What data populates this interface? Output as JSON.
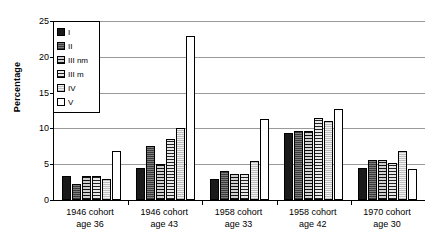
{
  "chart_data": {
    "type": "bar",
    "title": "",
    "xlabel": "",
    "ylabel": "Percentage",
    "ylim": [
      0,
      25
    ],
    "yticks": [
      0,
      5,
      10,
      15,
      20,
      25
    ],
    "grid": true,
    "legend_position": "top-left-inside",
    "categories": [
      "1946 cohort age 36",
      "1946 cohort age 43",
      "1958 cohort age 33",
      "1958 cohort age 42",
      "1970 cohort age 30"
    ],
    "category_lines": [
      [
        "1946 cohort",
        "age 36"
      ],
      [
        "1946 cohort",
        "age 43"
      ],
      [
        "1958 cohort",
        "age 33"
      ],
      [
        "1958 cohort",
        "age 42"
      ],
      [
        "1970 cohort",
        "age 30"
      ]
    ],
    "series": [
      {
        "name": "I",
        "fill": "solid-black",
        "values": [
          3.3,
          4.5,
          3.0,
          9.3,
          4.5
        ]
      },
      {
        "name": "II",
        "fill": "dark-dotted",
        "values": [
          2.2,
          7.6,
          4.0,
          9.6,
          5.6
        ]
      },
      {
        "name": "III nm",
        "fill": "h-lines",
        "values": [
          3.3,
          5.0,
          3.7,
          9.6,
          5.6
        ]
      },
      {
        "name": "III m",
        "fill": "crosshatch",
        "values": [
          3.3,
          8.5,
          3.7,
          11.4,
          5.2
        ]
      },
      {
        "name": "IV",
        "fill": "light-dotted",
        "values": [
          3.0,
          10.0,
          5.5,
          11.0,
          6.8
        ]
      },
      {
        "name": "V",
        "fill": "white",
        "values": [
          6.8,
          22.9,
          11.3,
          12.7,
          4.4
        ]
      }
    ]
  },
  "legend": {
    "items": [
      {
        "label": "I"
      },
      {
        "label": "II"
      },
      {
        "label": "III nm"
      },
      {
        "label": "III m"
      },
      {
        "label": "IV"
      },
      {
        "label": "V"
      }
    ]
  }
}
